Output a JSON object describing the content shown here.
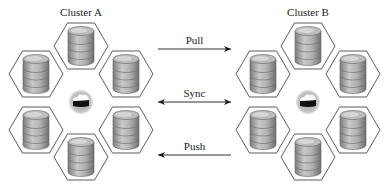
{
  "clusters": [
    {
      "name": "Cluster A",
      "center": [
        81,
        102
      ],
      "label_pos": [
        81,
        6
      ],
      "nodes": [
        {
          "id": "top",
          "icon": "database-icon",
          "pos": [
            81,
            46
          ]
        },
        {
          "id": "upper-left",
          "icon": "database-icon",
          "pos": [
            36,
            74
          ]
        },
        {
          "id": "upper-right",
          "icon": "database-icon",
          "pos": [
            126,
            74
          ]
        },
        {
          "id": "lower-left",
          "icon": "database-icon",
          "pos": [
            36,
            130
          ]
        },
        {
          "id": "lower-right",
          "icon": "database-icon",
          "pos": [
            126,
            130
          ]
        },
        {
          "id": "bottom",
          "icon": "database-icon",
          "pos": [
            81,
            157
          ]
        }
      ],
      "hub_icon": "cloud-icon"
    },
    {
      "name": "Cluster B",
      "center": [
        308,
        102
      ],
      "label_pos": [
        308,
        6
      ],
      "nodes": [
        {
          "id": "top",
          "icon": "database-icon",
          "pos": [
            308,
            46
          ]
        },
        {
          "id": "upper-left",
          "icon": "database-icon",
          "pos": [
            263,
            74
          ]
        },
        {
          "id": "upper-right",
          "icon": "database-icon",
          "pos": [
            353,
            74
          ]
        },
        {
          "id": "lower-left",
          "icon": "database-icon",
          "pos": [
            263,
            130
          ]
        },
        {
          "id": "lower-right",
          "icon": "database-icon",
          "pos": [
            353,
            130
          ]
        },
        {
          "id": "bottom",
          "icon": "database-icon",
          "pos": [
            308,
            157
          ]
        }
      ],
      "hub_icon": "cloud-icon"
    }
  ],
  "links": [
    {
      "label": "Pull",
      "direction": "A-to-B",
      "y": 49,
      "x1": 158,
      "x2": 231
    },
    {
      "label": "Sync",
      "direction": "bidirectional",
      "y": 102,
      "x1": 158,
      "x2": 231
    },
    {
      "label": "Push",
      "direction": "B-to-A",
      "y": 155,
      "x1": 158,
      "x2": 231
    }
  ],
  "colors": {
    "hex_stroke": "#4a4a4a",
    "cylinder_body": "#9a9a9a",
    "cylinder_light": "#d0d0d0",
    "hub_ring": "#bdbdbd",
    "arrow": "#1a1a1a"
  }
}
